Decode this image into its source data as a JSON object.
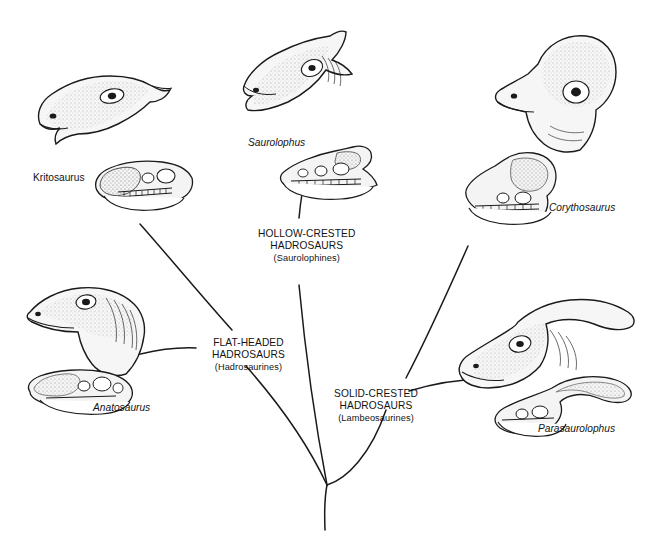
{
  "diagram": {
    "type": "cladogram",
    "background_color": "#ffffff",
    "line_color": "#1a1a1a",
    "text_color": "#131313"
  },
  "groups": [
    {
      "id": "hollow-crested",
      "line1": "HOLLOW-CRESTED",
      "line2": "HADROSAURS",
      "subtitle": "(Saurolophines)",
      "x": 258,
      "y": 228
    },
    {
      "id": "flat-headed",
      "line1": "FLAT-HEADED",
      "line2": "HADROSAURS",
      "subtitle": "(Hadrosaurines)",
      "x": 212,
      "y": 337
    },
    {
      "id": "solid-crested",
      "line1": "SOLID-CRESTED",
      "line2": "HADROSAURS",
      "subtitle": "(Lambeosaurines)",
      "x": 334,
      "y": 388
    }
  ],
  "taxa": [
    {
      "id": "kritosaurus",
      "name": "Kritosaurus",
      "style": "upright",
      "x": 33,
      "y": 172
    },
    {
      "id": "saurolophus",
      "name": "Saurolophus",
      "style": "italic",
      "x": 248,
      "y": 137
    },
    {
      "id": "corythosaurus",
      "name": "Corythosaurus",
      "style": "italic",
      "x": 549,
      "y": 202
    },
    {
      "id": "anatosaurus",
      "name": "Anatosaurus",
      "style": "italic",
      "x": 93,
      "y": 402
    },
    {
      "id": "parasaurolophus",
      "name": "Parasaurolophus",
      "style": "italic",
      "x": 538,
      "y": 423
    }
  ],
  "illustrations": [
    {
      "id": "kritosaurus-head",
      "label": "Kritosaurus head",
      "kind": "head"
    },
    {
      "id": "kritosaurus-skull",
      "label": "Kritosaurus skull",
      "kind": "skull"
    },
    {
      "id": "saurolophus-head",
      "label": "Saurolophus head",
      "kind": "head"
    },
    {
      "id": "saurolophus-skull",
      "label": "Saurolophus skull",
      "kind": "skull"
    },
    {
      "id": "corythosaurus-head",
      "label": "Corythosaurus head",
      "kind": "head"
    },
    {
      "id": "corythosaurus-skull",
      "label": "Corythosaurus skull",
      "kind": "skull"
    },
    {
      "id": "anatosaurus-head",
      "label": "Anatosaurus head",
      "kind": "head"
    },
    {
      "id": "anatosaurus-skull",
      "label": "Anatosaurus skull",
      "kind": "skull"
    },
    {
      "id": "parasaurolophus-head",
      "label": "Parasaurolophus head",
      "kind": "head"
    },
    {
      "id": "parasaurolophus-skull",
      "label": "Parasaurolophus skull",
      "kind": "skull"
    }
  ]
}
